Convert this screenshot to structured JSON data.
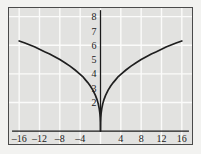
{
  "chart_data": {
    "type": "line",
    "title": "",
    "subtitle": "",
    "xlabel": "",
    "ylabel": "",
    "xlim": [
      -18,
      18
    ],
    "ylim": [
      -0.9,
      8.6
    ],
    "grid": true,
    "grid_color": "#fbfbfa",
    "background_color": "#e2e2e0",
    "frame_color": "#4a4a4a",
    "axis_color": "#1a1a1a",
    "curve_color": "#1f1f1f",
    "legend": [],
    "legend_position": "none",
    "x_ticks": [
      -16,
      -12,
      -8,
      -4,
      4,
      8,
      12,
      16
    ],
    "x_tick_labels": [
      "–16",
      "–12",
      "–8",
      "–4",
      "4",
      "8",
      "12",
      "16"
    ],
    "y_ticks": [
      2,
      3,
      4,
      5,
      6,
      7,
      8
    ],
    "y_tick_labels": [
      "2",
      "3",
      "4",
      "5",
      "6",
      "7",
      "8"
    ],
    "x_gridlines": [
      -16,
      -12,
      -8,
      -4,
      0,
      4,
      8,
      12,
      16
    ],
    "y_gridlines": [
      2,
      4,
      6,
      8
    ],
    "series": [
      {
        "name": "y = 2.5·|x|^(1/3)",
        "x": [
          -16,
          -15,
          -14,
          -13,
          -12,
          -11,
          -10,
          -9,
          -8,
          -7,
          -6,
          -5,
          -4,
          -3.5,
          -3,
          -2.5,
          -2,
          -1.5,
          -1,
          -0.7,
          -0.45,
          -0.25,
          -0.12,
          -0.05,
          -0.015,
          0,
          0.015,
          0.05,
          0.12,
          0.25,
          0.45,
          0.7,
          1,
          1.5,
          2,
          2.5,
          3,
          3.5,
          4,
          5,
          6,
          7,
          8,
          9,
          10,
          11,
          12,
          13,
          14,
          15,
          16
        ],
        "y": [
          6.3,
          6.17,
          6.03,
          5.89,
          5.72,
          5.55,
          5.39,
          5.2,
          5.0,
          4.78,
          4.54,
          4.27,
          3.97,
          3.81,
          3.6,
          3.39,
          3.15,
          2.86,
          2.5,
          2.22,
          1.92,
          1.57,
          1.23,
          0.92,
          0.61,
          0,
          0.61,
          0.92,
          1.23,
          1.57,
          1.92,
          2.22,
          2.5,
          2.86,
          3.15,
          3.39,
          3.6,
          3.81,
          3.97,
          4.27,
          4.54,
          4.78,
          5.0,
          5.2,
          5.39,
          5.55,
          5.72,
          5.89,
          6.03,
          6.17,
          6.3
        ]
      }
    ],
    "annotations": []
  }
}
